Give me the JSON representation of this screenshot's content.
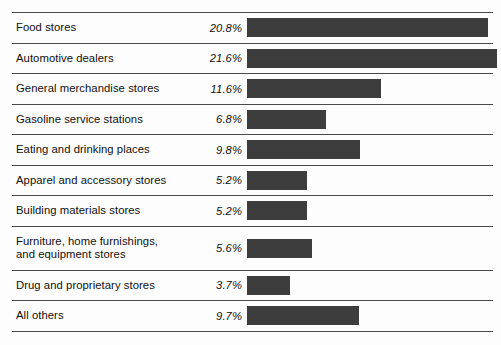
{
  "figure": {
    "name": "retail-sales-share-bar-chart",
    "bar_color": "#3d3d3d",
    "rule_color": "#4a4a4a",
    "background": "#fdfdfd"
  },
  "chart_data": {
    "type": "bar",
    "orientation": "horizontal",
    "title": "",
    "subtitle": "",
    "xlabel": "",
    "ylabel": "",
    "xlim": [
      0,
      21.6
    ],
    "grid": false,
    "legend": null,
    "value_suffix": "%",
    "categories": [
      "Food stores",
      "Automotive dealers",
      "General merchandise stores",
      "Gasoline service stations",
      "Eating and drinking places",
      "Apparel and accessory stores",
      "Building materials stores",
      "Furniture, home furnishings, and equipment stores",
      "Drug and proprietary stores",
      "All others"
    ],
    "values": [
      20.8,
      21.6,
      11.6,
      6.8,
      9.8,
      5.2,
      5.2,
      5.6,
      3.7,
      9.7
    ],
    "value_labels": [
      "20.8%",
      "21.6%",
      "11.6%",
      "6.8%",
      "9.8%",
      "5.2%",
      "5.2%",
      "5.6%",
      "3.7%",
      "9.7%"
    ]
  },
  "rows": [
    {
      "label_lines": [
        "Food stores"
      ],
      "label": "Food stores",
      "value_label": "20.8%",
      "value": 20.8
    },
    {
      "label_lines": [
        "Automotive dealers"
      ],
      "label": "Automotive dealers",
      "value_label": "21.6%",
      "value": 21.6
    },
    {
      "label_lines": [
        "General merchandise stores"
      ],
      "label": "General merchandise stores",
      "value_label": "11.6%",
      "value": 11.6
    },
    {
      "label_lines": [
        "Gasoline service stations"
      ],
      "label": "Gasoline service stations",
      "value_label": "6.8%",
      "value": 6.8
    },
    {
      "label_lines": [
        "Eating and drinking places"
      ],
      "label": "Eating and drinking places",
      "value_label": "9.8%",
      "value": 9.8
    },
    {
      "label_lines": [
        "Apparel and accessory stores"
      ],
      "label": "Apparel and accessory stores",
      "value_label": "5.2%",
      "value": 5.2
    },
    {
      "label_lines": [
        "Building materials stores"
      ],
      "label": "Building materials stores",
      "value_label": "5.2%",
      "value": 5.2
    },
    {
      "label_lines": [
        "Furniture, home furnishings,",
        "and equipment stores"
      ],
      "label": "Furniture, home furnishings, and equipment stores",
      "value_label": "5.6%",
      "value": 5.6
    },
    {
      "label_lines": [
        "Drug and proprietary stores"
      ],
      "label": "Drug and proprietary stores",
      "value_label": "3.7%",
      "value": 3.7
    },
    {
      "label_lines": [
        "All others"
      ],
      "label": "All others",
      "value_label": "9.7%",
      "value": 9.7
    }
  ],
  "scale": {
    "pixels_per_percent": 11.58,
    "bar_origin_x": 235
  }
}
